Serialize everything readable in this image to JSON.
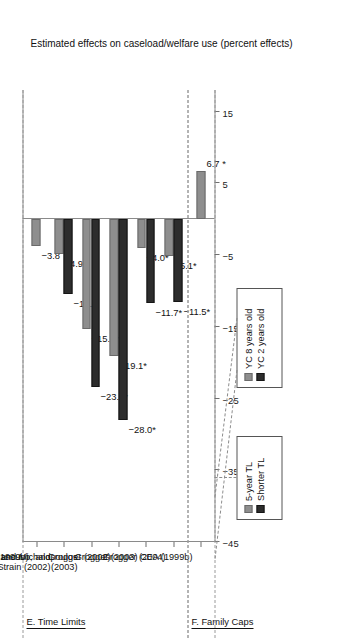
{
  "figure": {
    "axis_title": "Estimated effects on caseload/welfare use (percent effects)",
    "value_ticks": [
      "15",
      "5",
      "−5",
      "−15",
      "−25",
      "−35",
      "−45"
    ],
    "sections": [
      {
        "label": "E. Time Limits"
      },
      {
        "label": "F. Family Caps"
      }
    ],
    "legends": [
      {
        "name": "time-limit-legend",
        "entries": [
          {
            "label": "5-year TL",
            "color": "#8e8e8e",
            "style": "light"
          },
          {
            "label": "Shorter TL",
            "color": "#2d2d2d",
            "style": "dark"
          }
        ]
      },
      {
        "name": "youngest-child-legend",
        "entries": [
          {
            "label": "YC 8 years old",
            "color": "#8e8e8e",
            "style": "light"
          },
          {
            "label": "YC 2 years old",
            "color": "#2d2d2d",
            "style": "dark"
          }
        ]
      }
    ]
  },
  "chart_data": {
    "type": "bar",
    "title": "",
    "xlabel": "",
    "ylabel": "Estimated effects on caseload/welfare use (percent effects)",
    "ylim": [
      -45,
      18
    ],
    "yticks": [
      15,
      5,
      -5,
      -15,
      -25,
      -35,
      -45
    ],
    "grid": false,
    "legend_position": "top",
    "orientation": "vertical-rotated",
    "categories": [
      "CEA (1999b)",
      "MaCurdy, Mancuso, and\nO'Brien -Strain (2002)",
      "Grogger and Michalopoulos\n(2003)",
      "Grogger (2002)",
      "Grogger (2003)",
      "Grogger (2004)",
      "CEA (1999b)"
    ],
    "category_sections": [
      "E. Time Limits",
      "E. Time Limits",
      "E. Time Limits",
      "E. Time Limits",
      "E. Time Limits",
      "E. Time Limits",
      "F. Family Caps"
    ],
    "series": [
      {
        "name": "Series A (light)",
        "color": "#8e8e8e",
        "values": [
          -3.8,
          -4.9,
          -15.3,
          -19.1,
          -4.0,
          -5.1,
          6.7
        ],
        "labels": [
          "−3.8",
          "−4.9",
          "−15.3*",
          "−19.1*",
          "−4.0*",
          "−5.1*",
          "6.7 *"
        ]
      },
      {
        "name": "Series B (dark)",
        "color": "#2d2d2d",
        "values": [
          null,
          -10.5,
          -23.4,
          -28.0,
          -11.7,
          -11.5,
          null
        ],
        "labels": [
          null,
          "−10.5",
          "−23.4*",
          "−28.0*",
          "−11.7*",
          "−11.5*",
          null
        ]
      }
    ],
    "annotations": [
      {
        "text": "5-year TL",
        "applies_to_series": "light",
        "scope": "categories 2-3"
      },
      {
        "text": "Shorter TL",
        "applies_to_series": "dark",
        "scope": "categories 2-3"
      },
      {
        "text": "YC 8 years old",
        "applies_to_series": "light",
        "scope": "categories 3-4"
      },
      {
        "text": "YC 2 years old",
        "applies_to_series": "dark",
        "scope": "categories 3-4"
      }
    ]
  }
}
